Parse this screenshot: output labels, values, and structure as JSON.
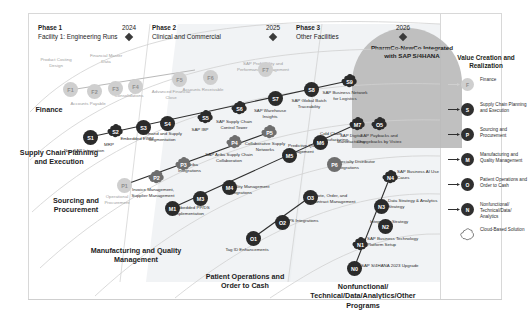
{
  "diagram": {
    "goal_label": "PharmCo-NewCo Integrated with SAP S/4HANA",
    "phases": [
      {
        "title": "Phase 1",
        "subtitle": "Facility 1: Engineering Runs"
      },
      {
        "title": "Phase 2",
        "subtitle": "Clinical and Commercial"
      },
      {
        "title": "Phase 3",
        "subtitle": "Other Facilities"
      }
    ],
    "years": [
      "2024",
      "2025",
      "2026"
    ],
    "lanes": [
      "Finance",
      "Supply Chain Planning and Execution",
      "Sourcing and Procurement",
      "Manufacturing and Quality Management",
      "Patient Operations and Order to Cash",
      "Nonfunctional/ Technical/Data/Analytics/Other Programs"
    ]
  },
  "legend": {
    "title": "Value Creation and Realization",
    "items": [
      {
        "code": "F",
        "label": "Finance",
        "tone": "light"
      },
      {
        "code": "S",
        "label": "Supply Chain Planning and Execution",
        "tone": "dark"
      },
      {
        "code": "P",
        "label": "Sourcing and Procurement",
        "tone": "dark"
      },
      {
        "code": "M",
        "label": "Manufacturing and Quality Management",
        "tone": "dark"
      },
      {
        "code": "O",
        "label": "Patient Operations and Order to Cash",
        "tone": "dark"
      },
      {
        "code": "N",
        "label": "Nonfunctional/ Technical/Data/ Analytics",
        "tone": "dark"
      },
      {
        "code": "",
        "label": "Cloud-Based Solution",
        "tone": "cloud"
      }
    ]
  },
  "nodes": [
    {
      "id": "F1",
      "label": "Product Costing Design",
      "tone": "light",
      "x": 63,
      "y": 82,
      "lx": 35,
      "ly": 57,
      "lw": 42,
      "align": "center",
      "shape": "circle"
    },
    {
      "id": "F2",
      "label": "Accounts Payable",
      "tone": "light",
      "x": 87,
      "y": 84,
      "lx": 67,
      "ly": 101,
      "lw": 42,
      "align": "center",
      "shape": "circle"
    },
    {
      "id": "F3",
      "label": "Financial Master Data",
      "tone": "light",
      "x": 108,
      "y": 81,
      "lx": 85,
      "ly": 53,
      "lw": 42,
      "align": "center",
      "shape": "circle"
    },
    {
      "id": "F4",
      "label": "Consolidations",
      "tone": "light",
      "x": 128,
      "y": 79,
      "lx": 108,
      "ly": 93,
      "lw": 42,
      "align": "center",
      "shape": "circle"
    },
    {
      "id": "F5",
      "label": "Advanced Financial Close",
      "tone": "light",
      "x": 172,
      "y": 72,
      "lx": 150,
      "ly": 89,
      "lw": 42,
      "align": "center",
      "shape": "circle"
    },
    {
      "id": "F6",
      "label": "Accounts Receivable",
      "tone": "light",
      "x": 203,
      "y": 70,
      "lx": 182,
      "ly": 87,
      "lw": 42,
      "align": "center",
      "shape": "circle"
    },
    {
      "id": "F7",
      "label": "SAP Profitability and Performance Management",
      "tone": "light",
      "x": 258,
      "y": 62,
      "lx": 232,
      "ly": 61,
      "lw": 62,
      "align": "center",
      "shape": "circle"
    },
    {
      "id": "S1",
      "label": "Non-SAP Integration",
      "tone": "dark",
      "x": 83,
      "y": 130,
      "lx": 62,
      "ly": 148,
      "lw": 44,
      "align": "center",
      "shape": "circle"
    },
    {
      "id": "S2",
      "label": "MRP",
      "tone": "dark",
      "x": 108,
      "y": 124,
      "lx": 92,
      "ly": 142,
      "lw": 34,
      "align": "center",
      "shape": "cloud"
    },
    {
      "id": "S3",
      "label": "Embedded EWM",
      "tone": "dark",
      "x": 136,
      "y": 120,
      "lx": 115,
      "ly": 136,
      "lw": 44,
      "align": "center",
      "shape": "circle"
    },
    {
      "id": "S4",
      "label": "Demand and Supply Segmentation",
      "tone": "dark",
      "x": 160,
      "y": 116,
      "lx": 140,
      "ly": 131,
      "lw": 44,
      "align": "center",
      "shape": "circle"
    },
    {
      "id": "S5",
      "label": "SAP IBP",
      "tone": "dark",
      "x": 198,
      "y": 110,
      "lx": 178,
      "ly": 127,
      "lw": 44,
      "align": "center",
      "shape": "cloud"
    },
    {
      "id": "S6",
      "label": "SAP Supply Chain Control Tower",
      "tone": "dark",
      "x": 232,
      "y": 101,
      "lx": 209,
      "ly": 119,
      "lw": 50,
      "align": "center",
      "shape": "cloud"
    },
    {
      "id": "S7",
      "label": "SAP Warehouse Insights",
      "tone": "dark",
      "x": 268,
      "y": 91,
      "lx": 248,
      "ly": 108,
      "lw": 44,
      "align": "center",
      "shape": "circle"
    },
    {
      "id": "S8",
      "label": "SAP Global Batch Traceability",
      "tone": "dark",
      "x": 304,
      "y": 82,
      "lx": 285,
      "ly": 98,
      "lw": 48,
      "align": "center",
      "shape": "circle"
    },
    {
      "id": "S9",
      "label": "SAP Business Network for Logistics",
      "tone": "dark",
      "x": 342,
      "y": 74,
      "lx": 322,
      "ly": 90,
      "lw": 46,
      "align": "center",
      "shape": "cloud"
    },
    {
      "id": "P1",
      "label": "Operational Procurement",
      "tone": "light",
      "x": 117,
      "y": 178,
      "lx": 95,
      "ly": 194,
      "lw": 44,
      "align": "center",
      "shape": "circle"
    },
    {
      "id": "P2",
      "label": "Invoice Management, Supplier Management",
      "tone": "mid",
      "x": 149,
      "y": 170,
      "lx": 126,
      "ly": 187,
      "lw": 54,
      "align": "center",
      "shape": "cloud"
    },
    {
      "id": "P3",
      "label": "SAP Ariba Integrations",
      "tone": "mid",
      "x": 176,
      "y": 157,
      "lx": 178,
      "ly": 162,
      "lw": 44,
      "align": "left",
      "shape": "cloud"
    },
    {
      "id": "P4",
      "label": "SAP Ariba Supply Chain Collaboration",
      "tone": "mid",
      "x": 227,
      "y": 135,
      "lx": 203,
      "ly": 152,
      "lw": 52,
      "align": "center",
      "shape": "cloud"
    },
    {
      "id": "P5",
      "label": "Collaborative Supply Networks",
      "tone": "mid",
      "x": 262,
      "y": 125,
      "lx": 241,
      "ly": 141,
      "lw": 48,
      "align": "center",
      "shape": "cloud"
    },
    {
      "id": "P6",
      "label": "Specialty Distributor Integrations",
      "tone": "mid",
      "x": 327,
      "y": 157,
      "lx": 336,
      "ly": 159,
      "lw": 50,
      "align": "left",
      "shape": "circle"
    },
    {
      "id": "M1",
      "label": "Embedded PP/DS Implementation",
      "tone": "dark",
      "x": 165,
      "y": 201,
      "lx": 174,
      "ly": 205,
      "lw": 50,
      "align": "left",
      "shape": "circle"
    },
    {
      "id": "M3",
      "label": "",
      "tone": "dark",
      "x": 193,
      "y": 191,
      "lx": 0,
      "ly": 0,
      "lw": 0,
      "align": "center",
      "shape": "circle"
    },
    {
      "id": "M4",
      "label": "Quality Management Integrations",
      "tone": "dark",
      "x": 222,
      "y": 180,
      "lx": 229,
      "ly": 184,
      "lw": 48,
      "align": "left",
      "shape": "circle"
    },
    {
      "id": "M5",
      "label": "Predictive Quality Management",
      "tone": "dark",
      "x": 282,
      "y": 148,
      "lx": 288,
      "ly": 143,
      "lw": 46,
      "align": "left",
      "shape": "circle"
    },
    {
      "id": "M6",
      "label": "Cold Chain Manufacturing",
      "tone": "dark",
      "x": 313,
      "y": 135,
      "lx": 320,
      "ly": 131,
      "lw": 44,
      "align": "left",
      "shape": "circle"
    },
    {
      "id": "M7",
      "label": "SAP Digital Manufacturing",
      "tone": "dark",
      "x": 350,
      "y": 117,
      "lx": 329,
      "ly": 133,
      "lw": 44,
      "align": "center",
      "shape": "cloud"
    },
    {
      "id": "O1",
      "label": "Tag ID Enhancements",
      "tone": "dark",
      "x": 246,
      "y": 231,
      "lx": 225,
      "ly": 247,
      "lw": 44,
      "align": "center",
      "shape": "circle"
    },
    {
      "id": "O2",
      "label": "GPS Integrations",
      "tone": "dark",
      "x": 275,
      "y": 215,
      "lx": 285,
      "ly": 218,
      "lw": 42,
      "align": "left",
      "shape": "circle"
    },
    {
      "id": "O3",
      "label": "Quote, Order, and Contract Management",
      "tone": "dark",
      "x": 303,
      "y": 190,
      "lx": 312,
      "ly": 193,
      "lw": 50,
      "align": "left",
      "shape": "circle"
    },
    {
      "id": "O5",
      "label": "SAP Paybacks and Chargebacks by Vistex",
      "tone": "dark",
      "x": 372,
      "y": 117,
      "lx": 355,
      "ly": 133,
      "lw": 48,
      "align": "center",
      "shape": "cloud"
    },
    {
      "id": "N0",
      "label": "SAP S/4HANA 2023 Upgrade",
      "tone": "dark",
      "x": 347,
      "y": 261,
      "lx": 361,
      "ly": 263,
      "lw": 62,
      "align": "left",
      "shape": "circle"
    },
    {
      "id": "N1",
      "label": "SAP Business Technology Platform Setup",
      "tone": "dark",
      "x": 353,
      "y": 237,
      "lx": 367,
      "ly": 236,
      "lw": 56,
      "align": "left",
      "shape": "cloud"
    },
    {
      "id": "N2",
      "label": "Integration Strategy",
      "tone": "dark",
      "x": 378,
      "y": 219,
      "lx": 370,
      "ly": 219,
      "lw": 56,
      "align": "left",
      "shape": "circle"
    },
    {
      "id": "N3",
      "label": "Data Strategy & Analytics Strategy",
      "tone": "dark",
      "x": 374,
      "y": 199,
      "lx": 388,
      "ly": 198,
      "lw": 52,
      "align": "left",
      "shape": "circle"
    },
    {
      "id": "N4",
      "label": "SAP Business AI Use Cases",
      "tone": "dark",
      "x": 383,
      "y": 170,
      "lx": 397,
      "ly": 169,
      "lw": 48,
      "align": "left",
      "shape": "cloud"
    }
  ]
}
